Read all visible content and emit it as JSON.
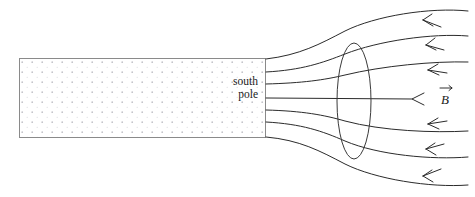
{
  "figure": {
    "background_color": "#ffffff",
    "line_color": "#2b2b2b",
    "magnet_border_color": "#8a8a8a",
    "hatch_dot_color": "#bfbfc6",
    "label_color": "#1a1a1a"
  },
  "magnet": {
    "label_line_1": "south",
    "label_line_2": "pole",
    "x": 19,
    "y": 58,
    "width": 247,
    "height": 80,
    "fill_pattern": "dotted-stipple",
    "dot_spacing": 10
  },
  "flux_ellipse": {
    "name": "flux-surface-ellipse",
    "cx": 354,
    "cy": 101,
    "rx": 17,
    "ry": 58
  },
  "b_field": {
    "label": "B",
    "vector_notation": "arrow-over",
    "label_x": 447,
    "label_y": 103,
    "arrow_tip_x": 410,
    "arrow_y": 99
  },
  "field_lines": [
    {
      "name": "field-line-1",
      "start_y": 59,
      "end_y": 11,
      "end_x": 468,
      "arrow_angle": -27
    },
    {
      "name": "field-line-2",
      "start_y": 72,
      "end_y": 36,
      "end_x": 468,
      "arrow_angle": -21
    },
    {
      "name": "field-line-3",
      "start_y": 84,
      "end_y": 62,
      "end_x": 468,
      "arrow_angle": -12
    },
    {
      "name": "field-line-4",
      "start_y": 98,
      "end_y": 99,
      "end_x": 412,
      "arrow_angle": 0
    },
    {
      "name": "field-line-5",
      "start_y": 110,
      "end_y": 131,
      "end_x": 468,
      "arrow_angle": 12
    },
    {
      "name": "field-line-6",
      "start_y": 122,
      "end_y": 157,
      "end_x": 468,
      "arrow_angle": 21
    },
    {
      "name": "field-line-7",
      "start_y": 137,
      "end_y": 185,
      "end_x": 468,
      "arrow_angle": 27
    }
  ],
  "arrow_direction": "leftward-into-magnet",
  "field_line_count": 7
}
